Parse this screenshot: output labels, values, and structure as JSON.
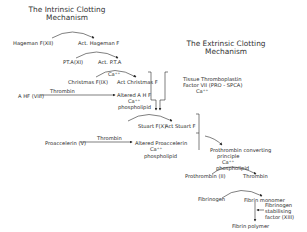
{
  "titles": {
    "intrinsic_line1": "The Intrinsic Clotting",
    "intrinsic_line2": "Mechanism",
    "extrinsic_line1": "The Extrinsic Clotting",
    "extrinsic_line2": "Mechanism"
  },
  "nodes": {
    "hageman": "Hageman  F(XII)",
    "act_hageman": "Act. Hageman F",
    "pta": "PT.A(XI)",
    "act_pta": "Act. P.T.A",
    "ca_christmas": "Ca⁺⁺",
    "christmas": "Christmas  F(IX)",
    "act_christmas": "Act Christmas F",
    "ahf": "A HF (VIII)",
    "thrombin_1": "Thrombin",
    "altered_ahf": "Altered A H F",
    "ca_ahf": "Ca⁺⁺",
    "phospholipid_1": "phospholipid",
    "tissue_thrombo": "Tissue  Thromboplastin",
    "factor_vii": "Factor VII (PRO - SPCA)",
    "ca_extrinsic": "Ca⁺⁺",
    "stuart": "Stuart F(X)",
    "act_stuart": "Act Stuart F",
    "proaccelerin": "Proaccelerin (V)",
    "thrombin_2": "Thrombin",
    "altered_proaccelerin": "Altered  Proaccelerin",
    "ca_proacc": "Ca⁺⁺",
    "phospholipid_2": "phospholipid",
    "prothrombin_converting": "Prothrombin  converting",
    "principle": "principle",
    "ca_prothrombin": "Ca⁺⁺",
    "phospholipid_3": "phospholipid",
    "prothrombin": "Prothrombin (II)",
    "thrombin_3": "Thrombin",
    "fibrinogen": "Fibrinogen",
    "fibrin_monomer": "Fibrin  monomer",
    "fsf_1": "Fibrinogen",
    "fsf_2": "stabilising",
    "fsf_3": "factor (XIII)",
    "fibrin_polymer": "Fibrin   polymer"
  },
  "colors": {
    "ink": "#2a2a2a",
    "background": "#ffffff"
  }
}
